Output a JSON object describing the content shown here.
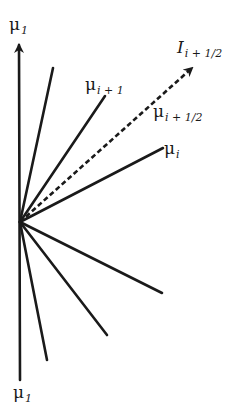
{
  "diagram": {
    "origin": [
      20,
      222
    ],
    "stroke_color": "#1a1a1a",
    "axis": {
      "top": [
        19,
        43
      ],
      "bottom": [
        20,
        380
      ],
      "top_label": {
        "main": "μ",
        "sub": "1"
      },
      "bottom_label": {
        "main": "μ",
        "sub": "1"
      }
    },
    "upper_lines": [
      {
        "end": [
          53,
          68
        ],
        "label": null
      },
      {
        "end": [
          105,
          96
        ],
        "label": {
          "main": "μ",
          "sub": "i + 1"
        }
      },
      {
        "end": [
          163,
          148
        ],
        "label": {
          "main": "μ",
          "sub": "i"
        }
      }
    ],
    "dashed_arrow": {
      "end": [
        192,
        68
      ],
      "label": {
        "main": "I",
        "sub": "i + 1/2"
      },
      "mid_label": {
        "main": "μ",
        "sub": "i + 1/2"
      }
    },
    "lower_lines": [
      {
        "end": [
          162,
          293
        ]
      },
      {
        "end": [
          107,
          335
        ]
      },
      {
        "end": [
          47,
          360
        ]
      }
    ]
  }
}
